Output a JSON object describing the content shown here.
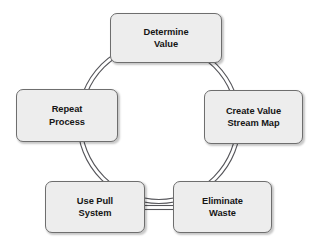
{
  "diagram": {
    "type": "cycle",
    "background_color": "#ffffff",
    "ring": {
      "name": "cycle-ring",
      "style": "double-stroke-circle",
      "center_x": 159,
      "center_y": 122,
      "outer_radius": 82,
      "inner_radius": 78,
      "stroke_color": "#55555a",
      "stroke_width": 1.1
    },
    "box_style": {
      "fill_color": "#ededed",
      "border_color": "#6e6e6e",
      "text_color": "#151515",
      "corner_radius": 7
    },
    "nodes": [
      {
        "id": "determine-value",
        "position": "top",
        "line1": "Determine",
        "line2": "Value"
      },
      {
        "id": "create-value-stream-map",
        "position": "right",
        "line1": "Create Value",
        "line2": "Stream Map"
      },
      {
        "id": "eliminate-waste",
        "position": "bottom-right",
        "line1": "Eliminate",
        "line2": "Waste"
      },
      {
        "id": "use-pull-system",
        "position": "bottom-left",
        "line1": "Use Pull",
        "line2": "System"
      },
      {
        "id": "repeat-process",
        "position": "left",
        "line1": "Repeat",
        "line2": "Process"
      }
    ],
    "connector_bottom": {
      "name": "bottom-connector",
      "style": "double-line-horizontal",
      "from": "use-pull-system",
      "to": "eliminate-waste"
    }
  }
}
